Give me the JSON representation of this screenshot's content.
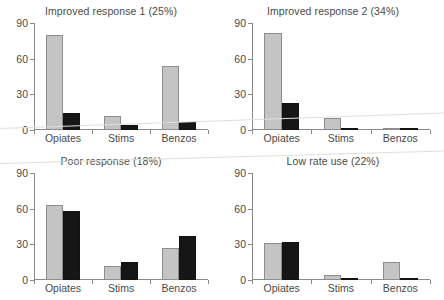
{
  "figure": {
    "background_color": "#ffffff",
    "series_colors": {
      "series_1": "#c4c4c4",
      "series_2": "#161616"
    },
    "axis_color": "#8a8a8a"
  },
  "chart_data": [
    {
      "type": "bar",
      "title": "Improved response 1 (25%)",
      "categories": [
        "Opiates",
        "Stims",
        "Benzos"
      ],
      "series": [
        {
          "name": "series_1",
          "values": [
            80,
            12,
            54
          ]
        },
        {
          "name": "series_2",
          "values": [
            14,
            4,
            7
          ]
        }
      ],
      "xlabel": "",
      "ylabel": "",
      "ylim": [
        0,
        90
      ],
      "yticks": [
        0,
        30,
        60,
        90
      ],
      "ytick_labels": [
        "0",
        "30",
        "60",
        "90"
      ],
      "grid": false,
      "legend": "none"
    },
    {
      "type": "bar",
      "title": "Improved response 2 (34%)",
      "categories": [
        "Opiates",
        "Stims",
        "Benzos"
      ],
      "series": [
        {
          "name": "series_1",
          "values": [
            82,
            10,
            1
          ]
        },
        {
          "name": "series_2",
          "values": [
            23,
            2,
            2
          ]
        }
      ],
      "xlabel": "",
      "ylabel": "",
      "ylim": [
        0,
        90
      ],
      "yticks": [
        0,
        30,
        60,
        90
      ],
      "ytick_labels": [
        "0",
        "30",
        "60",
        "90"
      ],
      "grid": false,
      "legend": "none"
    },
    {
      "type": "bar",
      "title": "Poor response (18%)",
      "categories": [
        "Opiates",
        "Stims",
        "Benzos"
      ],
      "series": [
        {
          "name": "series_1",
          "values": [
            63,
            12,
            27
          ]
        },
        {
          "name": "series_2",
          "values": [
            58,
            15,
            37
          ]
        }
      ],
      "xlabel": "",
      "ylabel": "",
      "ylim": [
        0,
        90
      ],
      "yticks": [
        0,
        30,
        60,
        90
      ],
      "ytick_labels": [
        "0",
        "30",
        "60",
        "90"
      ],
      "grid": false,
      "legend": "none"
    },
    {
      "type": "bar",
      "title": "Low rate use (22%)",
      "categories": [
        "Opiates",
        "Stims",
        "Benzos"
      ],
      "series": [
        {
          "name": "series_1",
          "values": [
            31,
            4,
            15
          ]
        },
        {
          "name": "series_2",
          "values": [
            32,
            2,
            2
          ]
        }
      ],
      "xlabel": "",
      "ylabel": "",
      "ylim": [
        0,
        90
      ],
      "yticks": [
        0,
        30,
        60,
        90
      ],
      "ytick_labels": [
        "0",
        "30",
        "60",
        "90"
      ],
      "grid": false,
      "legend": "none"
    }
  ]
}
